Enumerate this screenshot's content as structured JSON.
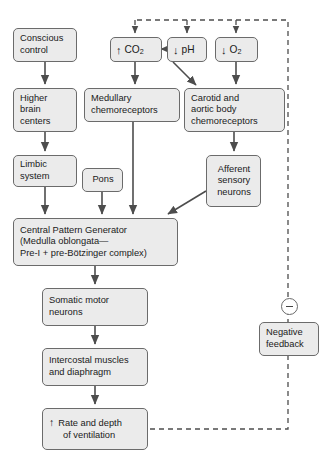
{
  "diagram": {
    "colors": {
      "box_fill": "#ebebeb",
      "box_border": "#6b6b6b",
      "arrow": "#4d4d4d",
      "dashed": "#4d4d4d",
      "background": "#ffffff",
      "text": "#1a1a1a"
    },
    "nodes": {
      "conscious_control": {
        "lines": [
          "Conscious",
          "control"
        ]
      },
      "higher_brain_centers": {
        "lines": [
          "Higher",
          "brain",
          "centers"
        ]
      },
      "limbic_system": {
        "lines": [
          "Limbic",
          "system"
        ]
      },
      "pons": {
        "lines": [
          "Pons"
        ]
      },
      "co2": {
        "glyph": "↑",
        "label": "CO",
        "sub": "2"
      },
      "ph": {
        "glyph": "↓",
        "label": "pH",
        "sub": ""
      },
      "o2": {
        "glyph": "↓",
        "label": "O",
        "sub": "2"
      },
      "medullary_chemoreceptors": {
        "lines": [
          "Medullary",
          "chemoreceptors"
        ]
      },
      "carotid_aortic_chemoreceptors": {
        "lines": [
          "Carotid and",
          "aortic body",
          "chemoreceptors"
        ]
      },
      "afferent_sensory_neurons": {
        "lines": [
          "Afferent",
          "sensory",
          "neurons"
        ]
      },
      "central_pattern_generator": {
        "lines": [
          "Central Pattern Generator",
          "(Medulla oblongata—",
          "Pre-I + pre-Bötzinger complex)"
        ]
      },
      "somatic_motor_neurons": {
        "lines": [
          "Somatic motor",
          "neurons"
        ]
      },
      "intercostal_muscles": {
        "lines": [
          "Intercostal muscles",
          "and diaphragm"
        ]
      },
      "rate_depth_ventilation": {
        "glyph": "↑",
        "lines": [
          "Rate and depth",
          "of ventilation"
        ]
      },
      "negative_feedback": {
        "lines": [
          "Negative",
          "feedback"
        ]
      },
      "minus_sign": {
        "symbol": "−"
      }
    }
  }
}
